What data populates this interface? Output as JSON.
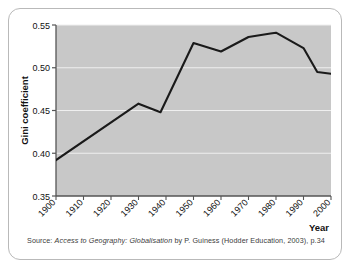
{
  "figure": {
    "source_prefix": "Source:",
    "source_title": "Access to Geography: Globalisation",
    "source_rest": "by P. Guiness (Hodder Education, 2003), p.34"
  },
  "chart_data": {
    "type": "line",
    "title": "",
    "xlabel": "Year",
    "ylabel": "Gini coefficient",
    "xlim": [
      1900,
      2000
    ],
    "ylim": [
      0.35,
      0.55
    ],
    "grid": true,
    "legend": "none",
    "plot_background": "#c8c8c8",
    "line_color": "#1a1a1a",
    "gridline_color": "#f2f2f2",
    "x_tick_labels": [
      "1900",
      "1910",
      "1920",
      "1930",
      "1940",
      "1950",
      "1960",
      "1970",
      "1980",
      "1990",
      "2000"
    ],
    "x_ticks": [
      1900,
      1910,
      1920,
      1930,
      1940,
      1950,
      1960,
      1970,
      1980,
      1990,
      2000
    ],
    "y_tick_labels": [
      "0.35",
      "0.40",
      "0.45",
      "0.50",
      "0.55"
    ],
    "y_ticks": [
      0.35,
      0.4,
      0.45,
      0.5,
      0.55
    ],
    "x": [
      1900,
      1930,
      1938,
      1950,
      1960,
      1970,
      1978,
      1980,
      1990,
      1995,
      2000
    ],
    "values": [
      0.392,
      0.458,
      0.448,
      0.529,
      0.519,
      0.536,
      0.54,
      0.541,
      0.523,
      0.495,
      0.493
    ],
    "series": [
      {
        "name": "Gini coefficient",
        "points": [
          {
            "x": 1900,
            "y": 0.392
          },
          {
            "x": 1930,
            "y": 0.458
          },
          {
            "x": 1938,
            "y": 0.448
          },
          {
            "x": 1950,
            "y": 0.529
          },
          {
            "x": 1960,
            "y": 0.519
          },
          {
            "x": 1970,
            "y": 0.536
          },
          {
            "x": 1978,
            "y": 0.54
          },
          {
            "x": 1980,
            "y": 0.541
          },
          {
            "x": 1990,
            "y": 0.523
          },
          {
            "x": 1995,
            "y": 0.495
          },
          {
            "x": 2000,
            "y": 0.493
          }
        ]
      }
    ]
  }
}
